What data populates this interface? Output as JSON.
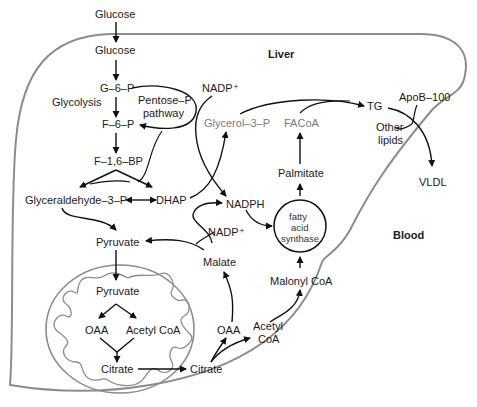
{
  "regions": {
    "liver": "Liver",
    "blood": "Blood"
  },
  "colors": {
    "membrane": "#8c8c8c",
    "arrow": "#111111",
    "text": "#1a1a1a",
    "grey_text": "#7a7a7a"
  },
  "nodes": {
    "glucose_blood": "Glucose",
    "glucose_liver": "Glucose",
    "g6p": "G–6–P",
    "glycolysis": "Glycolysis",
    "pentose_p_line1": "Pentose–P",
    "pentose_p_line2": "pathway",
    "f6p": "F–6–P",
    "f16bp": "F–1,6–BP",
    "nadp_top": "NADP⁺",
    "glyceraldehyde3p": "Glyceraldehyde–3–P",
    "dhap": "DHAP",
    "glycerol3p": "Glycerol–3–P",
    "facoa": "FACoA",
    "tg": "TG",
    "apob100": "ApoB–100",
    "other_lipids_line1": "Other",
    "other_lipids_line2": "lipids",
    "vldl": "VLDL",
    "palmitate": "Palmitate",
    "nadph": "NADPH",
    "fas_line1": "fatty",
    "fas_line2": "acid",
    "fas_line3": "synthase",
    "nadp_mid": "NADP⁺",
    "pyruvate_cyto": "Pyruvate",
    "malate": "Malate",
    "malonyl_coa": "Malonyl CoA",
    "pyruvate_mito": "Pyruvate",
    "oaa_mito": "OAA",
    "acetyl_coa_mito": "Acetyl CoA",
    "citrate_mito": "Citrate",
    "citrate_cyto": "Citrate",
    "oaa_cyto": "OAA",
    "acetyl_coa_cyto_line1": "Acetyl",
    "acetyl_coa_cyto_line2": "CoA"
  }
}
